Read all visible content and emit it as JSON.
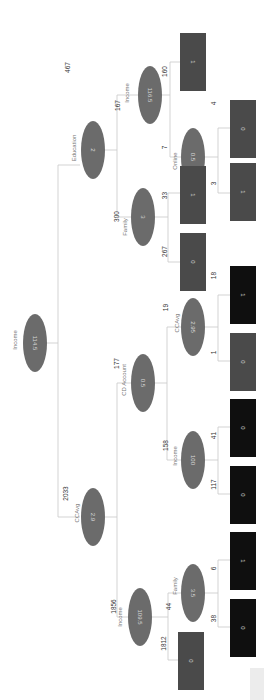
{
  "orientation": "rotated-90-clockwise",
  "colors": {
    "split_node": "#6b6b6b",
    "leaf_mid": "#555555",
    "leaf_dark": "#111111",
    "edge": "#c8c8c8"
  },
  "tree": {
    "root": {
      "feature": "Income",
      "threshold": "114.5"
    },
    "nodes": [
      {
        "id": "root",
        "feature": "Income",
        "threshold": "114.5"
      },
      {
        "id": "n_edu",
        "feature": "Education",
        "threshold": "2",
        "count": "467"
      },
      {
        "id": "n_ccavg",
        "feature": "CCAvg",
        "threshold": "2.9",
        "count": "2033"
      },
      {
        "id": "n_inc1165",
        "feature": "Income",
        "threshold": "116.5",
        "count": "167"
      },
      {
        "id": "n_fam3",
        "feature": "Family",
        "threshold": "3",
        "count": "300"
      },
      {
        "id": "n_cd",
        "feature": "CD Account",
        "threshold": "0.5",
        "count": "177"
      },
      {
        "id": "n_inc1095",
        "feature": "Income",
        "threshold": "109.5",
        "count": "1856"
      },
      {
        "id": "n_online",
        "feature": "Online",
        "threshold": "0.5",
        "count": "7"
      },
      {
        "id": "n_ccavg295",
        "feature": "CCAvg",
        "threshold": "2.95",
        "count": "19"
      },
      {
        "id": "n_inc100",
        "feature": "Income",
        "threshold": "100",
        "count": "158"
      },
      {
        "id": "n_fam35",
        "feature": "Family",
        "threshold": "3.5",
        "count": "44"
      }
    ],
    "leaves": [
      {
        "parent": "n_inc1165",
        "count": "160",
        "class": "1"
      },
      {
        "parent": "n_online",
        "count": "4",
        "class": "0"
      },
      {
        "parent": "n_online",
        "count": "3",
        "class": "1"
      },
      {
        "parent": "n_fam3",
        "count": "33",
        "class": "1"
      },
      {
        "parent": "n_fam3",
        "count": "267",
        "class": "0"
      },
      {
        "parent": "n_ccavg295",
        "count": "18",
        "class": "1"
      },
      {
        "parent": "n_ccavg295",
        "count": "1",
        "class": "0"
      },
      {
        "parent": "n_inc100",
        "count": "41",
        "class": "0"
      },
      {
        "parent": "n_inc100",
        "count": "117",
        "class": "0"
      },
      {
        "parent": "n_fam35",
        "count": "6",
        "class": "1"
      },
      {
        "parent": "n_fam35",
        "count": "38",
        "class": "0"
      },
      {
        "parent": "n_inc1095",
        "count": "1812",
        "class": "0"
      }
    ]
  },
  "labels": {
    "root_feature": "Income",
    "root_val": "114.5",
    "edu_feature": "Education",
    "edu_val": "2",
    "edu_count": "467",
    "ccavg_feature": "CCAvg",
    "ccavg_val": "2.9",
    "ccavg_count": "2033",
    "inc1165_feature": "Income",
    "inc1165_val": "116.5",
    "inc1165_count": "167",
    "fam3_feature": "Family",
    "fam3_val": "3",
    "fam3_count": "300",
    "cd_feature": "CD Account",
    "cd_val": "0.5",
    "cd_count": "177",
    "inc1095_feature": "Income",
    "inc1095_val": "109.5",
    "inc1095_count": "1856",
    "online_feature": "Online",
    "online_val": "0.5",
    "online_count": "7",
    "ccavg295_feature": "CCAvg",
    "ccavg295_val": "2.95",
    "ccavg295_count": "19",
    "inc100_feature": "Income",
    "inc100_val": "100",
    "inc100_count": "158",
    "fam35_feature": "Family",
    "fam35_val": "3.5",
    "fam35_count": "44",
    "leaf1_count": "160",
    "leaf1_class": "1",
    "leaf2_count": "4",
    "leaf2_class": "0",
    "leaf3_count": "3",
    "leaf3_class": "1",
    "leaf4_count": "33",
    "leaf4_class": "1",
    "leaf5_count": "267",
    "leaf5_class": "0",
    "leaf6_count": "18",
    "leaf6_class": "1",
    "leaf7_count": "1",
    "leaf7_class": "0",
    "leaf8_count": "41",
    "leaf8_class": "0",
    "leaf9_count": "117",
    "leaf9_class": "0",
    "leaf10_count": "6",
    "leaf10_class": "1",
    "leaf11_count": "38",
    "leaf11_class": "0",
    "leaf12_count": "1812",
    "leaf12_class": "0"
  }
}
